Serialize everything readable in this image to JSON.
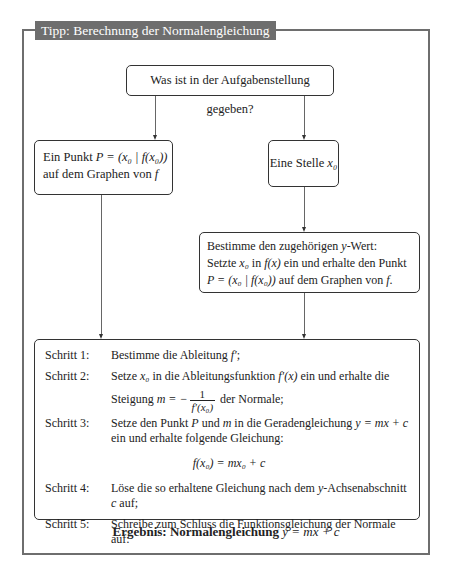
{
  "cropped_text": "— — — — — — — — — — — — — — —",
  "tip": {
    "title": "Tipp: Berechnung der Normalengleichung"
  },
  "flowchart": {
    "question_box": "Was ist in der Aufgabenstellung gegeben?",
    "left_branch": {
      "line1_text": "Ein Punkt ",
      "line1_math": "P = (x₀ | f(x₀))",
      "line2_text": "auf dem Graphen von ",
      "line2_math": "f"
    },
    "right_branch": {
      "text": "Eine Stelle ",
      "math": "x₀"
    },
    "determine_box": {
      "line1_a": "Bestimme den zugehörigen ",
      "line1_math": "y",
      "line1_b": "-Wert:",
      "line2_a": "Setzte ",
      "line2_math1": "x₀",
      "line2_b": " in ",
      "line2_math2": "f(x)",
      "line2_c": " ein und erhalte den Punkt",
      "line3_math": "P = (x₀ | f(x₀))",
      "line3_a": " auf dem Graphen von ",
      "line3_math2": "f",
      "line3_b": "."
    }
  },
  "steps": [
    {
      "label": "Schritt 1:",
      "text_a": "Bestimme die Ableitung ",
      "math": "f′",
      "text_b": ";"
    },
    {
      "label": "Schritt 2:",
      "text_a": "Setze ",
      "math1": "x₀",
      "text_b": " in die Ableitungsfunktion ",
      "math2": "f′(x)",
      "text_c": " ein und erhalte die",
      "text_d": "Steigung ",
      "math3": "m = −",
      "frac_num": "1",
      "frac_den": "f′(x₀)",
      "text_e": " der Normale;"
    },
    {
      "label": "Schritt 3:",
      "text_a": "Setze den Punkt ",
      "math1": "P",
      "text_b": " und ",
      "math2": "m",
      "text_c": " in die Geradengleichung ",
      "math3": "y = mx + c",
      "text_d": "ein und erhalte folgende Gleichung:",
      "equation": "f(x₀) = mx₀ + c"
    },
    {
      "label": "Schritt 4:",
      "text_a": "Löse die so erhaltene Gleichung nach dem ",
      "math1": "y",
      "text_b": "-Achsenabschnitt ",
      "math2": "c",
      "text_c": " auf;"
    },
    {
      "label": "Schritt 5:",
      "text_a": "Schreibe zum Schluss die Funktionsgleichung der Normale auf:"
    }
  ],
  "result": {
    "label": "Ergebnis: Normalengleichung",
    "math": "y = mx + c"
  }
}
